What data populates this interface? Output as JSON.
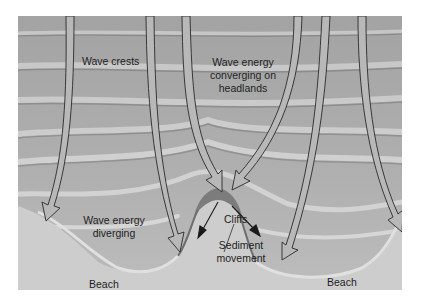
{
  "diagram": {
    "colors": {
      "water": "#9a9a9a",
      "wave_crest_light": "#c4c4c4",
      "land": "#cfcfcf",
      "arrow_fill": "#b5b5b5",
      "arrow_stroke": "#2a2a2a",
      "text": "#1e1e1e",
      "background": "#ffffff"
    },
    "labels": {
      "wave_crests": "Wave crests",
      "converging_line1": "Wave energy",
      "converging_line2": "converging on",
      "converging_line3": "headlands",
      "diverging_line1": "Wave energy",
      "diverging_line2": "diverging",
      "cliffs": "Cliffs",
      "sediment_line1": "Sediment",
      "sediment_line2": "movement",
      "beach_left": "Beach",
      "beach_right": "Beach"
    },
    "arrows": [
      {
        "name": "orthogonal-1",
        "direction": "down, curving left toward headland"
      },
      {
        "name": "orthogonal-2",
        "direction": "down, curving into left bay"
      },
      {
        "name": "orthogonal-3",
        "direction": "down, converging on headland"
      },
      {
        "name": "orthogonal-4",
        "direction": "down, converging on headland"
      },
      {
        "name": "orthogonal-5",
        "direction": "down, into right bay"
      },
      {
        "name": "orthogonal-6",
        "direction": "down, curving right"
      }
    ],
    "sediment_arrows": [
      {
        "name": "sediment-arrow-left",
        "direction": "from headland toward left bay"
      },
      {
        "name": "sediment-arrow-right",
        "direction": "from headland toward right bay"
      }
    ]
  }
}
